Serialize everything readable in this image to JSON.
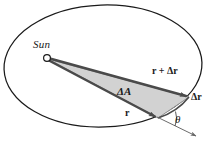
{
  "figure": {
    "background_color": "#ffffff",
    "outline_color": "#1a1a1a",
    "sector_fill_color": "#d2d2d2",
    "sector_edge_color": "#7a7a7a",
    "labels": {
      "sun": "Sun",
      "r_plus_dr": "r + Δr",
      "dr": "Δr",
      "delta_area": "ΔA",
      "r": "r",
      "theta": "θ"
    },
    "geometry": {
      "ellipse": {
        "center_x": 103,
        "center_y": 66,
        "radius_x": 99,
        "radius_y": 61,
        "rotation_deg": -2
      },
      "sun_marker": {
        "center_x": 47,
        "center_y": 58,
        "radius": 3.4
      },
      "vector_r": {
        "from_x": 48,
        "from_y": 60,
        "to_x": 158,
        "to_y": 118
      },
      "vector_r_plus_dr": {
        "from_x": 48,
        "from_y": 58,
        "to_x": 189,
        "to_y": 97
      },
      "tangent_line": {
        "from_x": 158,
        "from_y": 118,
        "to_x": 197,
        "to_y": 137
      },
      "angle_arc": {
        "vertex_x": 158,
        "vertex_y": 118,
        "label": "θ"
      }
    }
  }
}
